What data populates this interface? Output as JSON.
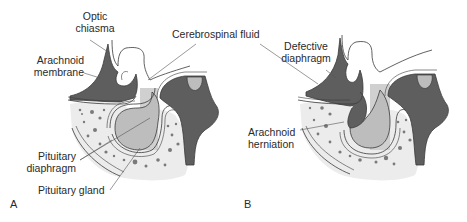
{
  "figure": {
    "panels": [
      {
        "letter": "A",
        "labels": {
          "optic_chiasma_1": "Optic",
          "optic_chiasma_2": "chiasma",
          "arachnoid_membrane_1": "Arachnoid",
          "arachnoid_membrane_2": "membrane",
          "pituitary_diaphragm_1": "Pituitary",
          "pituitary_diaphragm_2": "diaphragm",
          "pituitary_gland": "Pituitary gland"
        }
      },
      {
        "letter": "B",
        "labels": {
          "defective_diaphragm_1": "Defective",
          "defective_diaphragm_2": "diaphragm",
          "arachnoid_herniation_1": "Arachnoid",
          "arachnoid_herniation_2": "herniation"
        }
      }
    ],
    "shared_labels": {
      "cerebrospinal_fluid": "Cerebrospinal fluid"
    },
    "colors": {
      "dark_tissue": "#5e5e5e",
      "gland": "#bdbdbd",
      "bone": "#ececec",
      "dots": "#7a7a7a",
      "outline": "#3a3a3a",
      "leader": "#555555"
    }
  }
}
